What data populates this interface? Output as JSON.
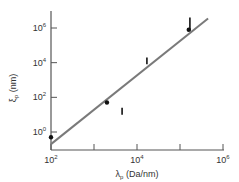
{
  "chart_data": {
    "type": "scatter",
    "title": "",
    "xlabel": "λp (Da/nm)",
    "ylabel": "ξp (nm)",
    "xscale": "log",
    "yscale": "log",
    "xlim": [
      100,
      1000000
    ],
    "ylim": [
      0.1,
      10000000
    ],
    "grid": false,
    "legend": null,
    "x_ticks": [
      {
        "value": 100,
        "label_base": "10",
        "label_exp": "2"
      },
      {
        "value": 1000,
        "label_base": "",
        "label_exp": ""
      },
      {
        "value": 10000,
        "label_base": "10",
        "label_exp": "4"
      },
      {
        "value": 100000,
        "label_base": "",
        "label_exp": ""
      },
      {
        "value": 1000000,
        "label_base": "10",
        "label_exp": "6"
      }
    ],
    "y_ticks": [
      {
        "value": 1,
        "label_base": "10",
        "label_exp": "0"
      },
      {
        "value": 100,
        "label_base": "10",
        "label_exp": "2"
      },
      {
        "value": 10000,
        "label_base": "10",
        "label_exp": "4"
      },
      {
        "value": 1000000,
        "label_base": "10",
        "label_exp": "6"
      }
    ],
    "series": [
      {
        "name": "points",
        "marker": "dot",
        "points": [
          {
            "x": 100,
            "y": 0.5
          },
          {
            "x": 2000,
            "y": 50
          },
          {
            "x": 160000,
            "y": 800000
          }
        ]
      },
      {
        "name": "ranges",
        "marker": "vertical-bar",
        "points": [
          {
            "x": 4500,
            "y_low": 10,
            "y_high": 25
          },
          {
            "x": 17000,
            "y_low": 8000,
            "y_high": 20000
          },
          {
            "x": 170000,
            "y_low": 700000,
            "y_high": 4000000
          }
        ]
      },
      {
        "name": "fit",
        "type": "line",
        "color": "#7a7a7a",
        "points": [
          {
            "x": 100,
            "y": 0.2
          },
          {
            "x": 450000,
            "y": 3500000
          }
        ]
      }
    ]
  },
  "labels": {
    "x_axis_symbol": "λ",
    "x_axis_sub": "p",
    "x_axis_units": " (Da/nm)",
    "y_axis_symbol": "ξ",
    "y_axis_sub": "p",
    "y_axis_units": " (nm)"
  },
  "colors": {
    "axis": "#555555",
    "fit_line": "#7a7a7a",
    "marker": "#111111",
    "text": "#333333"
  }
}
